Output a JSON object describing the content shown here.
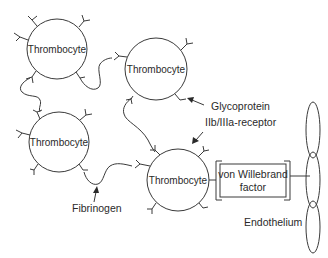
{
  "diagram": {
    "type": "platelet aggregation schematic",
    "cells": [
      {
        "id": "thrombocyte-1",
        "label": "Thrombocyte",
        "cx": 57,
        "cy": 49,
        "r": 30
      },
      {
        "id": "thrombocyte-2",
        "label": "Thrombocyte",
        "cx": 156,
        "cy": 69,
        "r": 31
      },
      {
        "id": "thrombocyte-3",
        "label": "Thrombocyte",
        "cx": 59,
        "cy": 142,
        "r": 30
      },
      {
        "id": "thrombocyte-4",
        "label": "Thrombocyte",
        "cx": 178,
        "cy": 180,
        "r": 31
      }
    ],
    "vwf": {
      "line1": "von Willebrand",
      "line2": "factor"
    },
    "labels": {
      "glycoprotein_line1": "Glycoprotein",
      "glycoprotein_line2": "IIb/IIIa-receptor",
      "fibrinogen": "Fibrinogen",
      "endothelium": "Endothelium"
    },
    "colors": {
      "line": "#3a3a3a",
      "text": "#2a2a2a",
      "background": "#ffffff"
    }
  }
}
